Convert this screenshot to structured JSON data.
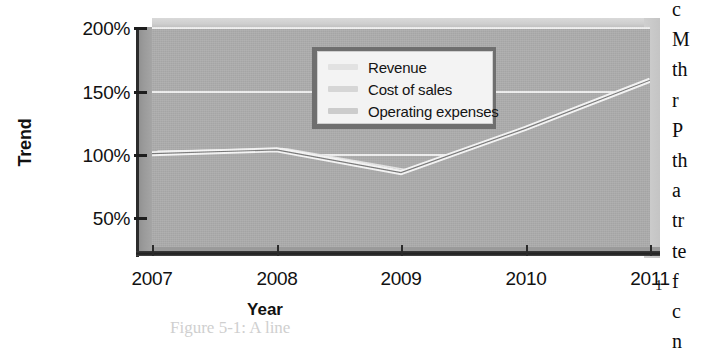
{
  "chart_data": {
    "type": "area",
    "title": "",
    "subtitle": "",
    "xlabel": "Year",
    "ylabel": "Trend",
    "categories": [
      "2007",
      "2008",
      "2009",
      "2010",
      "2011"
    ],
    "x": [
      2007,
      2008,
      2009,
      2010,
      2011
    ],
    "ytick_labels": [
      "200%",
      "150%",
      "100%",
      "50%"
    ],
    "ytick_values": [
      200,
      150,
      100,
      50
    ],
    "ylim": [
      0,
      200
    ],
    "yunit": "%",
    "grid": true,
    "grid_color": "#f2f2f2",
    "legend_position": "top-left-inside",
    "three_d": true,
    "plot_background": "#ababab",
    "series": [
      {
        "name": "Revenue",
        "color": "#e6e6e6",
        "values": [
          100,
          103,
          85,
          120,
          158
        ]
      },
      {
        "name": "Cost of sales",
        "color": "#dcdcdc",
        "values": [
          98,
          100,
          82,
          116,
          150
        ]
      },
      {
        "name": "Operating expenses",
        "color": "#d2d2d2",
        "values": [
          95,
          97,
          80,
          108,
          137
        ]
      }
    ],
    "annotations": []
  },
  "chart": {
    "y_axis_title": "Trend",
    "x_axis_title": "Year",
    "y_ticks": [
      {
        "label": "200%",
        "value": 200
      },
      {
        "label": "150%",
        "value": 150
      },
      {
        "label": "100%",
        "value": 100
      },
      {
        "label": "50%",
        "value": 50
      }
    ],
    "x_ticks": [
      {
        "label": "2007",
        "value": 2007
      },
      {
        "label": "2008",
        "value": 2008
      },
      {
        "label": "2009",
        "value": 2009
      },
      {
        "label": "2010",
        "value": 2010
      },
      {
        "label": "2011",
        "value": 2011
      }
    ],
    "legend": {
      "items": [
        {
          "label": "Revenue",
          "swatch": "#e2e2e2"
        },
        {
          "label": "Cost of sales",
          "swatch": "#d6d6d6"
        },
        {
          "label": "Operating expenses",
          "swatch": "#cccccc"
        }
      ]
    }
  },
  "body_column": {
    "lines": [
      "c",
      "M",
      "th",
      "r",
      "P",
      "th",
      "a",
      "tr",
      "te",
      "f",
      "c",
      "n"
    ]
  },
  "page": {
    "number": "1"
  },
  "ghost_text": {
    "line1": "Figure 5-1: A line"
  }
}
